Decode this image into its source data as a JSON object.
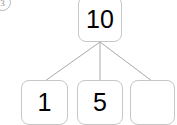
{
  "problem": {
    "number_label": "3"
  },
  "diagram": {
    "type": "number-bond",
    "whole": {
      "value": "10",
      "filled": true
    },
    "parts": [
      {
        "value": "1",
        "filled": true
      },
      {
        "value": "5",
        "filled": true
      },
      {
        "value": "",
        "filled": false
      }
    ],
    "connector_count": 3
  },
  "colors": {
    "background": "#ffffff",
    "box_border": "#c6c6c6",
    "connector_line": "#a8a8a8",
    "text": "#000000",
    "problem_number": "#8d8d8d"
  }
}
